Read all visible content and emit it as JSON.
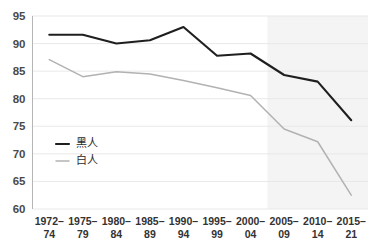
{
  "chart_data": {
    "type": "line",
    "title": "",
    "subtitle": "",
    "xlabel": "",
    "ylabel": "",
    "ylim": [
      60,
      95
    ],
    "ytick_step": 5,
    "yticks": [
      "60",
      "65",
      "70",
      "75",
      "80",
      "85",
      "90",
      "95"
    ],
    "grid": true,
    "legend_position": "inside-left",
    "categories": [
      "1972–74",
      "1975–79",
      "1980–84",
      "1985–89",
      "1990–94",
      "1995–99",
      "2000–04",
      "2005–09",
      "2010–14",
      "2015–21"
    ],
    "category_lines": [
      [
        "1972–",
        "74"
      ],
      [
        "1975–",
        "79"
      ],
      [
        "1980–",
        "84"
      ],
      [
        "1985–",
        "89"
      ],
      [
        "1990–",
        "94"
      ],
      [
        "1995–",
        "99"
      ],
      [
        "2000–",
        "04"
      ],
      [
        "2005–",
        "09"
      ],
      [
        "2010–",
        "14"
      ],
      [
        "2015–",
        "21"
      ]
    ],
    "series": [
      {
        "name": "黑人",
        "color": "#1f1f1f",
        "width": 2.1,
        "values": [
          91.6,
          91.6,
          90.0,
          90.6,
          93.0,
          87.8,
          88.2,
          84.3,
          83.1,
          76.1
        ]
      },
      {
        "name": "白人",
        "color": "#b2b2b2",
        "width": 1.5,
        "values": [
          87.1,
          84.0,
          84.9,
          84.5,
          83.3,
          82.0,
          80.6,
          74.5,
          72.2,
          62.5
        ]
      }
    ],
    "highlight_band": {
      "from_category": "2005–09",
      "to_category": "2015–21",
      "color": "#f4f4f4"
    },
    "colors": {
      "gridline": "#e6e6e6",
      "axis": "#b5b5b5",
      "tick_text": "#4a4a4a",
      "background": "#ffffff"
    }
  },
  "legend": {
    "entries": [
      {
        "label": "黑人",
        "color": "#1f1f1f"
      },
      {
        "label": "白人",
        "color": "#b2b2b2"
      }
    ]
  }
}
